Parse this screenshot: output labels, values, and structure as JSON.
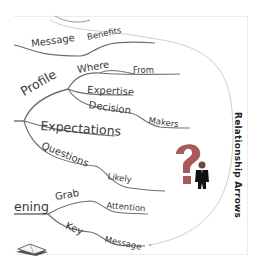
{
  "diagram": {
    "type": "mind-map",
    "side_label": "Relationship Arrows",
    "branches": [
      {
        "label": "Message",
        "children": [
          {
            "label": "Benefits"
          }
        ]
      },
      {
        "label": "Profile",
        "children": [
          {
            "label": "Where",
            "children": [
              {
                "label": "From"
              }
            ]
          },
          {
            "label": "Expertise"
          },
          {
            "label": "Decision",
            "children": [
              {
                "label": "Makers"
              }
            ]
          }
        ]
      },
      {
        "label": "Expectations"
      },
      {
        "label": "Questions",
        "children": [
          {
            "label": "Likely"
          }
        ]
      },
      {
        "label": "Opening",
        "visible_text": "ening",
        "children": [
          {
            "label": "Grab",
            "children": [
              {
                "label": "Attention"
              }
            ]
          },
          {
            "label": "Key",
            "children": [
              {
                "label": "Message"
              }
            ]
          }
        ]
      }
    ],
    "images": [
      {
        "name": "question-mark-person",
        "description": "red question mark with man in suit"
      },
      {
        "name": "book",
        "description": "open book clipart"
      }
    ],
    "colors": {
      "line": "#6e6e6e",
      "text": "#3a3a3a",
      "question_mark": "#a85a5a",
      "arrow": "#c8c8c8"
    }
  }
}
